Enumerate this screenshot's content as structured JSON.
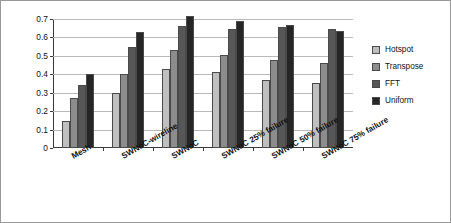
{
  "chart_data": {
    "type": "bar",
    "title": "",
    "xlabel": "",
    "ylabel": "Throughput (flits/core per cycle)",
    "ylim": [
      0,
      0.7
    ],
    "ytick_labels": [
      "0",
      "0.1",
      "0.2",
      "0.3",
      "0.4",
      "0.5",
      "0.6",
      "0.7"
    ],
    "ytick_values": [
      0,
      0.1,
      0.2,
      0.3,
      0.4,
      0.5,
      0.6,
      0.7
    ],
    "grid": true,
    "legend_position": "right",
    "categories": [
      "Mesh",
      "SWNoC-wireline",
      "SWNoC",
      "SWNoC 25% failure",
      "SWNoC 50% failure",
      "SWNoC 75% failure"
    ],
    "series": [
      {
        "name": "Hotspot",
        "color": "#bfbfbf",
        "values": [
          0.145,
          0.3,
          0.43,
          0.41,
          0.37,
          0.355
        ]
      },
      {
        "name": "Transpose",
        "color": "#8c8c8c",
        "values": [
          0.27,
          0.4,
          0.53,
          0.505,
          0.48,
          0.46
        ]
      },
      {
        "name": "FFT",
        "color": "#575757",
        "values": [
          0.34,
          0.55,
          0.66,
          0.645,
          0.655,
          0.645
        ]
      },
      {
        "name": "Uniform",
        "color": "#262626",
        "values": [
          0.4,
          0.63,
          0.715,
          0.69,
          0.665,
          0.635
        ]
      }
    ]
  }
}
